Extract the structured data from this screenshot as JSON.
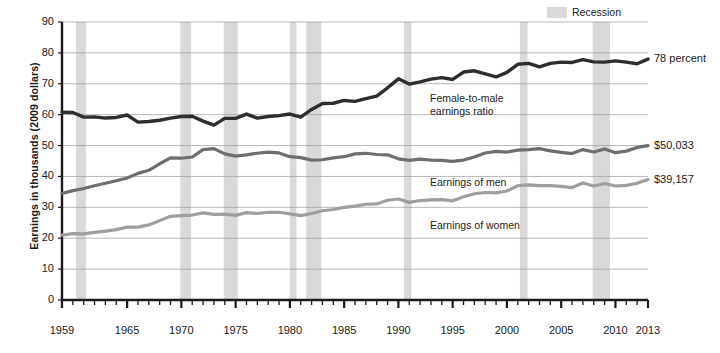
{
  "chart_data": {
    "type": "line",
    "title": "",
    "xlabel": "",
    "ylabel": "Earnings in thousands (2009 dollars)",
    "ylim": [
      0,
      90
    ],
    "yticks": [
      0,
      10,
      20,
      30,
      40,
      50,
      60,
      70,
      80,
      90
    ],
    "xlim": [
      1959,
      2013
    ],
    "xticks": [
      1959,
      1965,
      1970,
      1975,
      1980,
      1985,
      1990,
      1995,
      2000,
      2005,
      2010,
      2013
    ],
    "xtick_minor_step": 1,
    "grid": "horizontal",
    "legend": {
      "position": "top-right",
      "entries": [
        "Recession"
      ]
    },
    "x": [
      1959,
      1960,
      1961,
      1962,
      1963,
      1964,
      1965,
      1966,
      1967,
      1968,
      1969,
      1970,
      1971,
      1972,
      1973,
      1974,
      1975,
      1976,
      1977,
      1978,
      1979,
      1980,
      1981,
      1982,
      1983,
      1984,
      1985,
      1986,
      1987,
      1988,
      1989,
      1990,
      1991,
      1992,
      1993,
      1994,
      1995,
      1996,
      1997,
      1998,
      1999,
      2000,
      2001,
      2002,
      2003,
      2004,
      2005,
      2006,
      2007,
      2008,
      2009,
      2010,
      2011,
      2012,
      2013
    ],
    "series": [
      {
        "name": "Female-to-male earnings ratio",
        "unit": "percent",
        "color": "#2e2e2e",
        "end_label": "78 percent",
        "annotation": [
          "Female-to-male",
          "earnings ratio"
        ],
        "values": [
          60.8,
          60.7,
          59.2,
          59.3,
          58.9,
          59.1,
          59.9,
          57.6,
          57.8,
          58.2,
          58.9,
          59.4,
          59.5,
          57.9,
          56.6,
          58.8,
          58.8,
          60.2,
          58.9,
          59.4,
          59.7,
          60.2,
          59.2,
          61.7,
          63.6,
          63.7,
          64.6,
          64.3,
          65.2,
          66.0,
          68.7,
          71.6,
          69.9,
          70.6,
          71.5,
          72.0,
          71.4,
          73.8,
          74.2,
          73.2,
          72.2,
          73.7,
          76.3,
          76.6,
          75.5,
          76.6,
          77.0,
          76.9,
          77.8,
          77.1,
          77.0,
          77.4,
          77.0,
          76.5,
          78.0
        ]
      },
      {
        "name": "Earnings of men",
        "unit": "2009 dollars (thousands)",
        "color": "#6e6e6e",
        "end_label": "$50,033",
        "annotation": [
          "Earnings of men"
        ],
        "values": [
          34.5,
          35.4,
          36.1,
          37.0,
          37.8,
          38.6,
          39.5,
          41.0,
          42.0,
          44.1,
          46.0,
          45.9,
          46.3,
          48.7,
          49.0,
          47.3,
          46.6,
          47.0,
          47.5,
          47.9,
          47.6,
          46.4,
          46.1,
          45.3,
          45.4,
          46.0,
          46.4,
          47.3,
          47.5,
          47.1,
          47.0,
          45.7,
          45.2,
          45.6,
          45.3,
          45.2,
          44.9,
          45.3,
          46.3,
          47.6,
          48.1,
          47.9,
          48.5,
          48.7,
          49.0,
          48.3,
          47.8,
          47.4,
          48.7,
          47.9,
          48.9,
          47.7,
          48.2,
          49.4,
          50.0
        ]
      },
      {
        "name": "Earnings of women",
        "unit": "2009 dollars (thousands)",
        "color": "#9e9e9e",
        "end_label": "$39,157",
        "annotation": [
          "Earnings of women"
        ],
        "values": [
          21.0,
          21.5,
          21.4,
          21.9,
          22.3,
          22.8,
          23.6,
          23.6,
          24.3,
          25.7,
          27.1,
          27.3,
          27.5,
          28.2,
          27.7,
          27.8,
          27.4,
          28.3,
          28.0,
          28.4,
          28.4,
          27.9,
          27.3,
          28.0,
          28.9,
          29.3,
          30.0,
          30.4,
          31.0,
          31.1,
          32.3,
          32.7,
          31.6,
          32.2,
          32.4,
          32.5,
          32.1,
          33.4,
          34.4,
          34.8,
          34.7,
          35.3,
          37.0,
          37.3,
          37.0,
          37.0,
          36.8,
          36.4,
          37.9,
          36.9,
          37.7,
          36.9,
          37.1,
          37.8,
          39.0
        ]
      }
    ],
    "recessions": [
      {
        "start": 1960.3,
        "end": 1961.2
      },
      {
        "start": 1969.9,
        "end": 1970.9
      },
      {
        "start": 1973.9,
        "end": 1975.2
      },
      {
        "start": 1980.0,
        "end": 1980.6
      },
      {
        "start": 1981.5,
        "end": 1982.9
      },
      {
        "start": 1990.5,
        "end": 1991.2
      },
      {
        "start": 2001.2,
        "end": 2001.9
      },
      {
        "start": 2007.9,
        "end": 2009.5
      }
    ],
    "recession_color": "#d9d9d9"
  },
  "legend": {
    "recession_label": "Recession"
  },
  "axis": {
    "y_title": "Earnings in thousands (2009 dollars)"
  }
}
